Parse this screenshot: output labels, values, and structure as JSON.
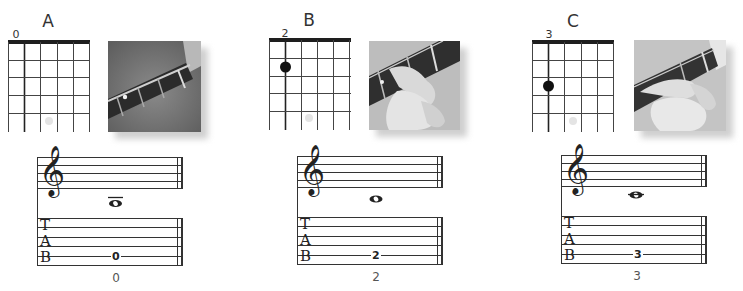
{
  "lesson": {
    "examples": [
      {
        "id": "A",
        "title": "A",
        "fret_label": "0",
        "fretted_dot": null,
        "photo_icon": "fretboard-open-string-photo",
        "notation": {
          "note": "E4-ledger-below",
          "ledger": "above"
        },
        "tab": {
          "string_line": 5,
          "fret": "0"
        },
        "caption": "0"
      },
      {
        "id": "B",
        "title": "B",
        "fret_label": "2",
        "fretted_dot": {
          "string": 2,
          "fret": 2
        },
        "photo_icon": "fretboard-finger-fret2-photo",
        "notation": {
          "note": "D4",
          "ledger": "none"
        },
        "tab": {
          "string_line": 5,
          "fret": "2"
        },
        "caption": "2"
      },
      {
        "id": "C",
        "title": "C",
        "fret_label": "3",
        "fretted_dot": {
          "string": 2,
          "fret": 3
        },
        "photo_icon": "fretboard-finger-fret3-photo",
        "notation": {
          "note": "C4",
          "ledger": "through"
        },
        "tab": {
          "string_line": 5,
          "fret": "3"
        },
        "caption": "3"
      }
    ],
    "tab_letters": [
      "T",
      "A",
      "B"
    ],
    "icons": {
      "clef": "treble-clef-icon",
      "note": "whole-note-icon"
    },
    "colors": {
      "line": "#222222",
      "grid": "#3a3a3a",
      "dot": "#111111",
      "faint_marker": "#e2e2e2",
      "photo_bg": "#7d7d7d"
    }
  }
}
